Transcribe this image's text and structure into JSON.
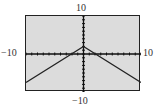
{
  "chart_data": {
    "type": "line",
    "title": "",
    "xlabel": "",
    "ylabel": "",
    "xlim": [
      -10,
      10
    ],
    "ylim": [
      -10,
      10
    ],
    "grid": false,
    "axis_ticks_scale": 1,
    "tick_labels": {
      "x_min": "−10",
      "x_max": "10",
      "y_min": "−10",
      "y_max": "10"
    },
    "series": [
      {
        "name": "graph",
        "x": [
          -10,
          0,
          10
        ],
        "values": [
          -7.5,
          2,
          -7.5
        ]
      }
    ],
    "colors": {
      "screen": "#dcdcdc",
      "line": "#222222"
    }
  }
}
